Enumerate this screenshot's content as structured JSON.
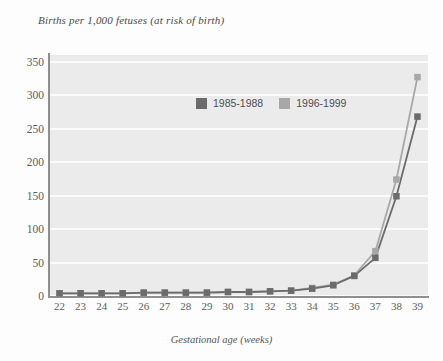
{
  "chart_data": {
    "type": "line",
    "title": "Births per 1,000 fetuses (at risk of birth)",
    "xlabel": "Gestational age (weeks)",
    "ylabel": "",
    "categories": [
      22,
      23,
      24,
      25,
      26,
      27,
      28,
      29,
      30,
      31,
      32,
      33,
      34,
      35,
      36,
      37,
      38,
      39
    ],
    "x": [
      22,
      23,
      24,
      25,
      26,
      27,
      28,
      29,
      30,
      31,
      32,
      33,
      34,
      35,
      36,
      37,
      38,
      39
    ],
    "series": [
      {
        "name": "1985-1988",
        "color": "#6b6b6b",
        "values": [
          4,
          4,
          4,
          4,
          5,
          5,
          5,
          5,
          6,
          6,
          7,
          8,
          11,
          16,
          30,
          57,
          149,
          268
        ]
      },
      {
        "name": "1996-1999",
        "color": "#a8a8a8",
        "values": [
          4,
          4,
          4,
          4,
          5,
          5,
          5,
          5,
          6,
          6,
          7,
          8,
          12,
          17,
          31,
          67,
          174,
          327
        ]
      }
    ],
    "ylim": [
      0,
      360
    ],
    "yticks": [
      0,
      50,
      100,
      150,
      200,
      250,
      300,
      350
    ],
    "ytick_labels": [
      "0",
      "50",
      "100",
      "150",
      "200",
      "250",
      "300",
      "350"
    ],
    "xtick_labels": [
      "22",
      "23",
      "24",
      "25",
      "26",
      "27",
      "28",
      "29",
      "30",
      "31",
      "32",
      "33",
      "34",
      "35",
      "36",
      "37",
      "38",
      "39"
    ],
    "grid": true,
    "grid_color": "#fbfbfb",
    "plot_background": "#ebebeb",
    "legend_position": "inside-top-center",
    "marker": "square"
  },
  "legend": {
    "entries": [
      {
        "label": "1985-1988",
        "color": "#6b6b6b"
      },
      {
        "label": "1996-1999",
        "color": "#a8a8a8"
      }
    ]
  }
}
